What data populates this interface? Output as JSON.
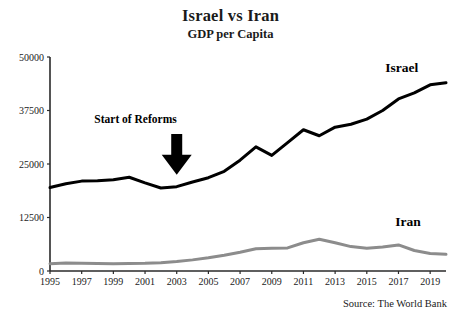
{
  "chart_data": {
    "type": "line",
    "title": "Israel vs Iran",
    "subtitle": "GDP per Capita",
    "xlabel": "",
    "ylabel": "",
    "ylim": [
      0,
      50000
    ],
    "xlim": [
      1995,
      2020
    ],
    "grid": false,
    "legend_position": "inline-right",
    "ytick_labels": [
      "0",
      "12500",
      "25000",
      "37500",
      "50000"
    ],
    "ytick_values": [
      0,
      12500,
      25000,
      37500,
      50000
    ],
    "xtick_labels": [
      "1995",
      "1997",
      "1999",
      "2001",
      "2003",
      "2005",
      "2007",
      "2009",
      "2011",
      "2013",
      "2015",
      "2017",
      "2019"
    ],
    "xtick_values": [
      1995,
      1997,
      1999,
      2001,
      2003,
      2005,
      2007,
      2009,
      2011,
      2013,
      2015,
      2017,
      2019
    ],
    "x": [
      1995,
      1996,
      1997,
      1998,
      1999,
      2000,
      2001,
      2002,
      2003,
      2004,
      2005,
      2006,
      2007,
      2008,
      2009,
      2010,
      2011,
      2012,
      2013,
      2014,
      2015,
      2016,
      2017,
      2018,
      2019,
      2020
    ],
    "series": [
      {
        "name": "Israel",
        "color": "#000000",
        "width": 3.0,
        "label_x": 2017.2,
        "label_y": 46500,
        "values": [
          19500,
          20400,
          21000,
          21100,
          21300,
          21900,
          20600,
          19400,
          19700,
          20800,
          21800,
          23300,
          25900,
          29000,
          27000,
          30000,
          33000,
          31600,
          33600,
          34300,
          35500,
          37500,
          40200,
          41600,
          43500,
          44000
        ]
      },
      {
        "name": "Iran",
        "color": "#8c8c8c",
        "width": 3.0,
        "label_x": 2017.6,
        "label_y": 10600,
        "values": [
          1700,
          1850,
          1800,
          1750,
          1720,
          1750,
          1800,
          1950,
          2200,
          2600,
          3100,
          3700,
          4400,
          5200,
          5300,
          5400,
          6600,
          7400,
          6600,
          5700,
          5300,
          5600,
          6100,
          4800,
          4100,
          3900
        ]
      }
    ],
    "annotations": [
      {
        "text": "Start of Reforms",
        "text_x": 2000.4,
        "text_y": 34500,
        "arrow_x": 2003.0,
        "arrow_top_y": 32000,
        "arrow_bottom_y": 22500
      }
    ],
    "source": "Source: The World Bank"
  }
}
